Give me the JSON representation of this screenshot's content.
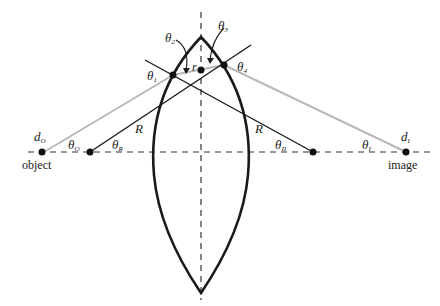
{
  "diagram": {
    "labels": {
      "object_point": "d",
      "object_point_sub": "O",
      "object_text": "object",
      "image_point": "d",
      "image_point_sub": "I",
      "image_text": "image",
      "theta": "θ",
      "theta_O_sub": "O",
      "theta_R_sub": "R",
      "theta_II_sub": "II",
      "theta_I_sub": "I",
      "theta_1_sub": "1",
      "theta_2_sub": "2",
      "theta_3_sub": "3",
      "theta_4_sub": "4",
      "radius_left": "R",
      "radius_right": "R",
      "r_label": "r"
    },
    "colors": {
      "lens": "#1a1a1a",
      "ray": "#b8b8b8",
      "radius_line": "#1a1a1a",
      "axis": "#333333",
      "point": "#111111"
    }
  }
}
